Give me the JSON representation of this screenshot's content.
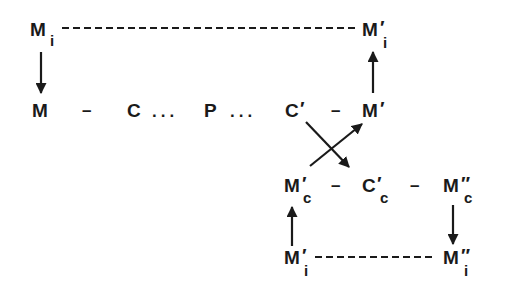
{
  "diagram": {
    "type": "circuit-of-capital-flow",
    "colors": {
      "ink": "#1a1a1a",
      "background": "#ffffff"
    },
    "nodes": {
      "Mi_top": {
        "base": "M",
        "prime": "",
        "sub": "i"
      },
      "Mi_prime_top": {
        "base": "M",
        "prime": "′",
        "sub": "i"
      },
      "M": {
        "base": "M",
        "prime": "",
        "sub": ""
      },
      "C": {
        "base": "C",
        "prime": "",
        "sub": ""
      },
      "P": {
        "base": "P",
        "prime": "",
        "sub": ""
      },
      "C_prime": {
        "base": "C",
        "prime": "′",
        "sub": ""
      },
      "M_prime": {
        "base": "M",
        "prime": "′",
        "sub": ""
      },
      "Mc_prime": {
        "base": "M",
        "prime": "′",
        "sub": "c"
      },
      "Cc_prime": {
        "base": "C",
        "prime": "′",
        "sub": "c"
      },
      "Mc_dprime": {
        "base": "M",
        "prime": "″",
        "sub": "c"
      },
      "Mi_prime_bottom": {
        "base": "M",
        "prime": "′",
        "sub": "i"
      },
      "Mi_dprime_bottom": {
        "base": "M",
        "prime": "″",
        "sub": "i"
      }
    },
    "separators": {
      "dash": "–",
      "dots": "..."
    },
    "edges": [
      {
        "from": "Mi_top",
        "to": "Mi_prime_top",
        "style": "dashed"
      },
      {
        "from": "Mi_top",
        "to": "M",
        "style": "arrow"
      },
      {
        "from": "M_prime",
        "to": "Mi_prime_top",
        "style": "arrow"
      },
      {
        "from": "C_prime",
        "to": "Cc_prime",
        "style": "arrow"
      },
      {
        "from": "Mc_prime",
        "to": "M_prime",
        "style": "arrow"
      },
      {
        "from": "Mi_prime_bottom",
        "to": "Mc_prime",
        "style": "arrow"
      },
      {
        "from": "Mc_dprime",
        "to": "Mi_dprime_bottom",
        "style": "arrow"
      },
      {
        "from": "Mi_prime_bottom",
        "to": "Mi_dprime_bottom",
        "style": "dashed"
      }
    ]
  }
}
